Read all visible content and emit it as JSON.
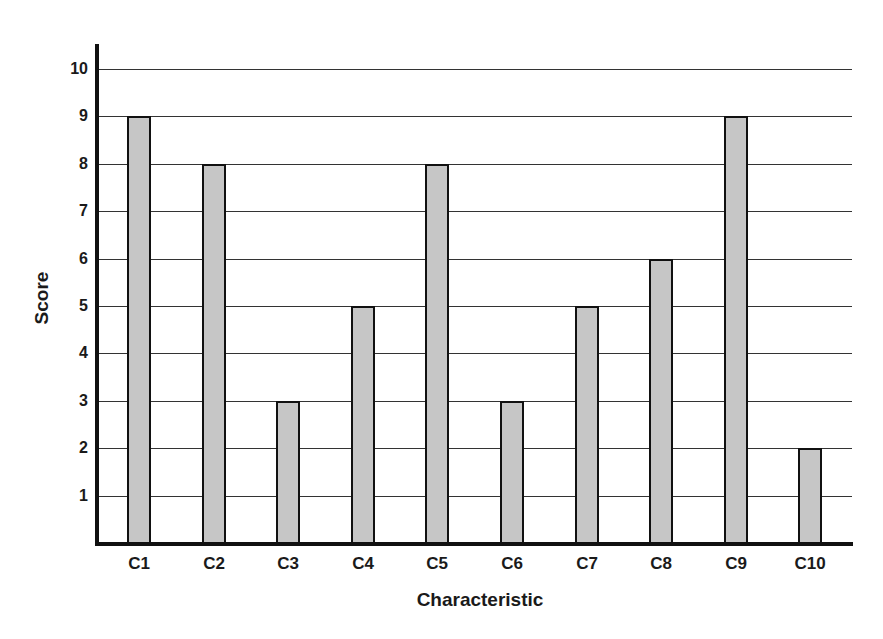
{
  "chart_data": {
    "type": "bar",
    "title": "",
    "xlabel": "Characteristic",
    "ylabel": "Score",
    "categories": [
      "C1",
      "C2",
      "C3",
      "C4",
      "C5",
      "C6",
      "C7",
      "C8",
      "C9",
      "C10"
    ],
    "values": [
      9,
      8,
      3,
      5,
      8,
      3,
      5,
      6,
      9,
      2
    ],
    "yticks": [
      1,
      2,
      3,
      4,
      5,
      6,
      7,
      8,
      9,
      10
    ],
    "ylim": [
      0,
      10.5
    ],
    "grid": true,
    "legend": null,
    "bar_color": "#c6c6c6",
    "bar_edge_color": "#111111"
  }
}
